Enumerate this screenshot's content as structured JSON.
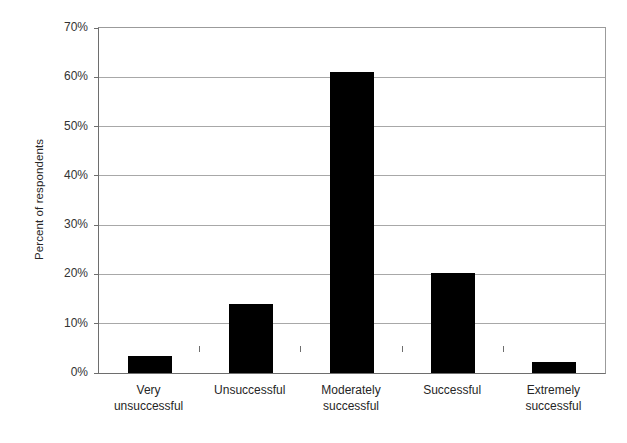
{
  "chart_data": {
    "type": "bar",
    "title": "",
    "xlabel": "",
    "ylabel": "Percent of respondents",
    "categories": [
      "Very unsuccessful",
      "Unsuccessful",
      "Moderately successful",
      "Successful",
      "Extremely successful"
    ],
    "category_lines": [
      [
        "Very",
        "unsuccessful"
      ],
      [
        "Unsuccessful",
        ""
      ],
      [
        "Moderately",
        "successful"
      ],
      [
        "Successful",
        ""
      ],
      [
        "Extremely",
        "successful"
      ]
    ],
    "values": [
      3.4,
      14.0,
      61.0,
      20.2,
      2.2
    ],
    "value_labels": [
      "3.4%",
      "14.0%",
      "61.0%",
      "20.2%",
      "2.2%"
    ],
    "ylim": [
      0,
      70
    ],
    "ytick_values": [
      0,
      10,
      20,
      30,
      40,
      50,
      60,
      70
    ],
    "ytick_labels": [
      "0%",
      "10%",
      "20%",
      "30%",
      "40%",
      "50%",
      "60%",
      "70%"
    ],
    "grid": true,
    "grid_axis": "y",
    "legend": false,
    "legend_position": "none",
    "bar_color": "#000000",
    "gridline_color": "#a8a8a8",
    "axis_color": "#6e6e6e",
    "background_color": "#ffffff"
  },
  "axes": {
    "y_title": "Percent of respondents"
  }
}
